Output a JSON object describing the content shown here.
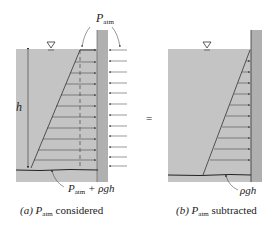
{
  "colors": {
    "fluid": "#c4c4c4",
    "wall": "#b0b0b0",
    "line": "#333333",
    "text": "#222222"
  },
  "panel_a": {
    "top_label_main": "P",
    "top_label_sub": "atm",
    "depth_label": "h",
    "bottom_label_main": "P",
    "bottom_label_sub": "atm",
    "bottom_label_rest": " + ρgh",
    "caption_prefix": "(a) ",
    "caption_main": "P",
    "caption_sub": "atm",
    "caption_rest": " considered"
  },
  "equals_sign": "=",
  "panel_b": {
    "bottom_label": "ρgh",
    "caption_prefix": "(b) ",
    "caption_main": "P",
    "caption_sub": "atm",
    "caption_rest": " subtracted"
  }
}
